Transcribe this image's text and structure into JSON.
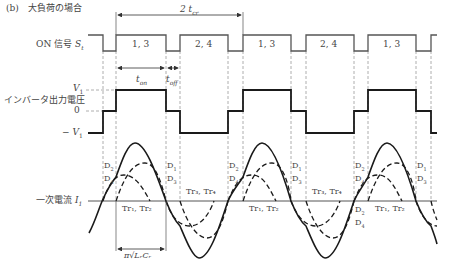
{
  "title": "(b)　大負荷の場合",
  "period_label": "2 t",
  "period_sub": "cr",
  "signals": {
    "on_signal": {
      "label": "ON 信号 ",
      "symbol": "S",
      "sub": "t"
    },
    "inverter_voltage": {
      "label": "インバータ出力電圧",
      "level_high": "V",
      "level_high_sub": "1",
      "level_zero": "0",
      "level_low": "− V",
      "level_low_sub": "1"
    },
    "primary_current": {
      "label": "一次電流 ",
      "symbol": "I",
      "sub": "1"
    }
  },
  "on_segments": [
    "1, 3",
    "2, 4",
    "1, 3",
    "2, 4",
    "1, 3"
  ],
  "timing": {
    "t_on": "t",
    "t_on_sub": "on",
    "t_off": "t",
    "t_off_sub": "off"
  },
  "diode_labels": {
    "d2d4": [
      "D",
      "2",
      "D",
      "4"
    ],
    "d1d3": [
      "D",
      "1",
      "D",
      "3"
    ]
  },
  "transistor_labels": {
    "tr1tr2": "Tr₁, Tr₂",
    "tr3tr4": "Tr₃, Tr₄"
  },
  "resonance_label": "π√LᵣCᵣ",
  "colors": {
    "line": "#1a1a1a",
    "signal": "#555555",
    "dash": "#888888"
  }
}
